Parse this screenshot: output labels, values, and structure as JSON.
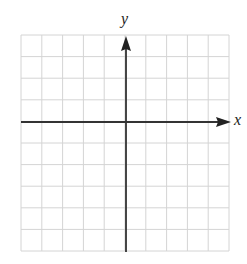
{
  "graph": {
    "x_axis_label": "x",
    "y_axis_label": "y",
    "grid": {
      "columns": 10,
      "rows": 10,
      "left": 21,
      "top": 35,
      "right": 229,
      "bottom": 251,
      "y_axis_x": 126,
      "x_axis_y": 122
    },
    "colors": {
      "grid_line": "#d4d4d4",
      "axis": "#333333"
    }
  }
}
